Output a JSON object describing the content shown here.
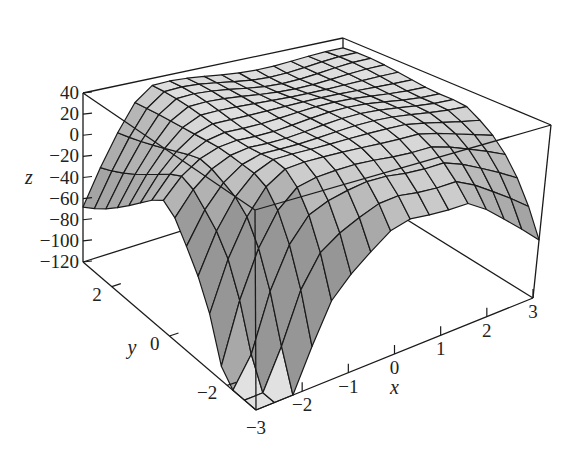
{
  "chart_data": {
    "type": "surface3d",
    "title": "",
    "xlabel": "x",
    "ylabel": "y",
    "zlabel": "z",
    "x_ticks": [
      "-3",
      "-2",
      "-1",
      "0",
      "1",
      "2",
      "3"
    ],
    "y_ticks": [
      "-2",
      "0",
      "2"
    ],
    "z_ticks": [
      "40",
      "20",
      "0",
      "-20",
      "-40",
      "-60",
      "-80",
      "-100",
      "-120"
    ],
    "xlim": [
      -3,
      3
    ],
    "ylim": [
      -3,
      3
    ],
    "zlim": [
      -120,
      40
    ],
    "grid": {
      "nx": 16,
      "ny": 16
    },
    "surface_color": "#d8d8d8",
    "edge_color": "#1a1a1a"
  },
  "labels": {
    "z": "z",
    "y": "y",
    "x": "x",
    "x_corner": "-3"
  }
}
